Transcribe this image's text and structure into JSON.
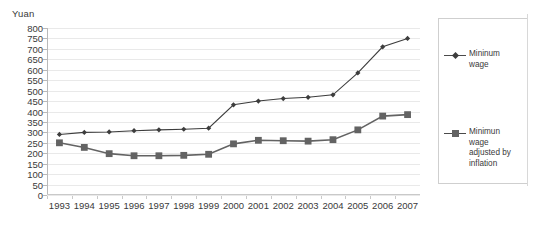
{
  "chart_data": {
    "type": "line",
    "title": "",
    "subtitle": "",
    "xlabel": "",
    "ylabel": "Yuan",
    "y_unit_caption": "Yuan",
    "categories": [
      "1993",
      "1994",
      "1995",
      "1996",
      "1997",
      "1998",
      "1999",
      "2000",
      "2001",
      "2002",
      "2003",
      "2004",
      "2005",
      "2006",
      "2007"
    ],
    "x": [
      1993,
      1994,
      1995,
      1996,
      1997,
      1998,
      1999,
      2000,
      2001,
      2002,
      2003,
      2004,
      2005,
      2006,
      2007
    ],
    "series": [
      {
        "name": "Mininum wage",
        "marker": "diamond",
        "color": "#3d3d3d",
        "values": [
          290,
          300,
          302,
          308,
          312,
          315,
          320,
          432,
          450,
          462,
          468,
          480,
          585,
          710,
          750
        ]
      },
      {
        "name": "Minimun wage adjusted by inflation",
        "marker": "square",
        "color": "#636363",
        "values": [
          250,
          228,
          198,
          188,
          188,
          190,
          195,
          245,
          262,
          260,
          258,
          265,
          312,
          378,
          385
        ]
      }
    ],
    "ylim": [
      0,
      800
    ],
    "yticks": [
      0,
      50,
      100,
      150,
      200,
      250,
      300,
      350,
      400,
      450,
      500,
      550,
      600,
      650,
      700,
      750,
      800
    ],
    "ytick_labels": [
      "0",
      "50",
      "100",
      "150",
      "200",
      "250",
      "300",
      "350",
      "400",
      "450",
      "500",
      "550",
      "600",
      "650",
      "700",
      "750",
      "800"
    ],
    "grid": true,
    "grid_axis": "y",
    "legend_position": "right",
    "legend": [
      {
        "label_lines": [
          "Mininum",
          "wage"
        ],
        "label": "Mininum wage",
        "marker": "diamond"
      },
      {
        "label_lines": [
          "Minimun",
          "wage",
          "adjusted by",
          "inflation"
        ],
        "label": "Minimun wage adjusted by inflation",
        "marker": "square"
      }
    ]
  },
  "colors": {
    "series_1": "#3d3d3d",
    "series_2": "#636363",
    "grid": "#e9e9e9",
    "axis": "#b9b9b9",
    "text": "#3a3a3a",
    "legend_border": "#cfcfcf",
    "background": "#ffffff"
  }
}
